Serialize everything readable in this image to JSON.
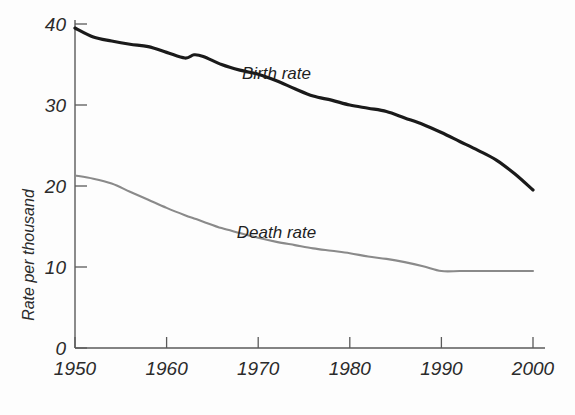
{
  "chart_data": {
    "type": "line",
    "title": "",
    "xlabel": "",
    "ylabel": "Rate per thousand",
    "xlim": [
      1950,
      2000
    ],
    "ylim": [
      0,
      40
    ],
    "grid": false,
    "legend_position": "inline-annotation",
    "xticks": [
      1950,
      1960,
      1970,
      1980,
      1990,
      2000
    ],
    "xtick_labels": [
      "1950",
      "1960",
      "1970",
      "1980",
      "1990",
      "2000"
    ],
    "yticks": [
      0,
      10,
      20,
      30,
      40
    ],
    "ytick_labels": [
      "0",
      "10",
      "20",
      "30",
      "40"
    ],
    "x": [
      1950,
      1952,
      1954,
      1956,
      1958,
      1960,
      1962,
      1963,
      1964,
      1966,
      1968,
      1970,
      1972,
      1974,
      1976,
      1978,
      1980,
      1982,
      1984,
      1986,
      1988,
      1990,
      1992,
      1994,
      1996,
      1998,
      2000
    ],
    "series": [
      {
        "name": "Birth rate",
        "color": "#1a1a1a",
        "line_width": 3.2,
        "label_x": 1972,
        "label_y": 33.2,
        "values": [
          39.5,
          38.4,
          37.9,
          37.5,
          37.2,
          36.5,
          35.8,
          36.2,
          36.0,
          35.0,
          34.3,
          33.8,
          33.0,
          32.0,
          31.1,
          30.6,
          30.0,
          29.6,
          29.2,
          28.4,
          27.6,
          26.6,
          25.5,
          24.4,
          23.2,
          21.5,
          19.5
        ]
      },
      {
        "name": "Death rate",
        "color": "#8a8a8a",
        "line_width": 2.1,
        "label_x": 1972,
        "label_y": 13.6,
        "values": [
          21.3,
          20.9,
          20.3,
          19.3,
          18.3,
          17.3,
          16.4,
          16.0,
          15.6,
          14.8,
          14.2,
          13.6,
          13.1,
          12.7,
          12.3,
          12.0,
          11.7,
          11.3,
          11.0,
          10.6,
          10.1,
          9.5,
          9.5,
          9.5,
          9.5,
          9.5,
          9.5
        ]
      }
    ]
  },
  "colors": {
    "background": "#fdfdfd",
    "axis": "#5a5a5a",
    "birth_rate": "#1a1a1a",
    "death_rate": "#8a8a8a",
    "text": "#2b2b2b"
  }
}
